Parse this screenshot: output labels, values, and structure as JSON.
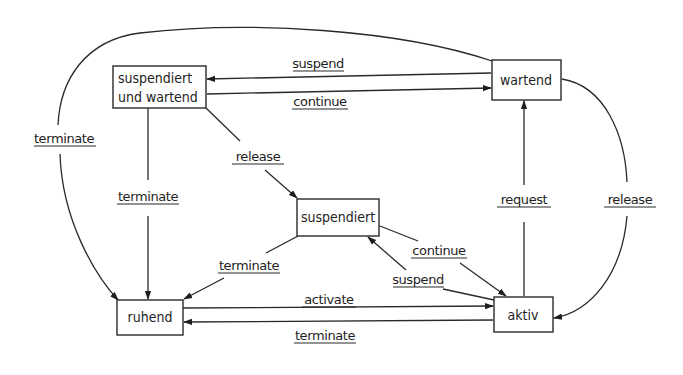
{
  "diagram": {
    "type": "state-transition",
    "states": {
      "susp_wait": {
        "line1": "suspendiert",
        "line2": "und wartend"
      },
      "waiting": {
        "label": "wartend"
      },
      "suspended": {
        "label": "suspendiert"
      },
      "idle": {
        "label": "ruhend"
      },
      "active": {
        "label": "aktiv"
      }
    },
    "transitions": {
      "t_suspend_top": {
        "label": "suspend",
        "from": "wartend",
        "to": "suspendiert und wartend"
      },
      "t_continue_top": {
        "label": "continue",
        "from": "suspendiert und wartend",
        "to": "wartend"
      },
      "t_terminate_outer": {
        "label": "terminate",
        "from": "wartend",
        "to": "ruhend"
      },
      "t_terminate_left": {
        "label": "terminate",
        "from": "suspendiert und wartend",
        "to": "ruhend"
      },
      "t_release_mid": {
        "label": "release",
        "from": "suspendiert und wartend",
        "to": "suspendiert"
      },
      "t_terminate_susp": {
        "label": "terminate",
        "from": "suspendiert",
        "to": "ruhend"
      },
      "t_continue_mid": {
        "label": "continue",
        "from": "suspendiert",
        "to": "aktiv"
      },
      "t_suspend_mid": {
        "label": "suspend",
        "from": "aktiv",
        "to": "suspendiert"
      },
      "t_activate": {
        "label": "activate",
        "from": "ruhend",
        "to": "aktiv"
      },
      "t_terminate_bottom": {
        "label": "terminate",
        "from": "aktiv",
        "to": "ruhend"
      },
      "t_request": {
        "label": "request",
        "from": "aktiv",
        "to": "wartend"
      },
      "t_release_right": {
        "label": "release",
        "from": "wartend",
        "to": "aktiv"
      }
    }
  }
}
